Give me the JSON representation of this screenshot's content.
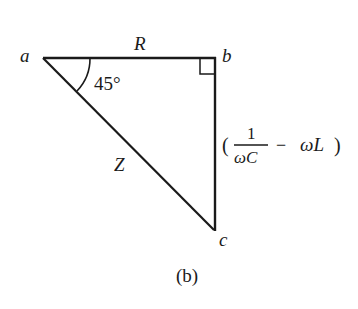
{
  "figure": {
    "caption": "(b)",
    "vertices": {
      "a": "a",
      "b": "b",
      "c": "c"
    },
    "sides": {
      "ab": "R",
      "ac": "Z",
      "bc": {
        "open_paren": "(",
        "numerator": "1",
        "denominator": "ωC",
        "minus": "−",
        "term": "ωL",
        "close_paren": ")"
      }
    },
    "angle_a": "45°",
    "right_angle_at": "b",
    "stroke_color": "#1a1a1a"
  }
}
